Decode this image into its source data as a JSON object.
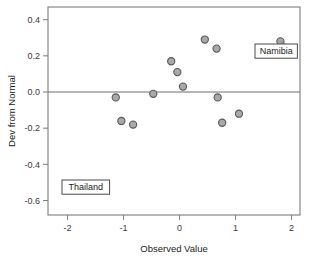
{
  "chart_data": {
    "type": "scatter",
    "title": "",
    "xlabel": "Observed Value",
    "ylabel": "Dev from Normal",
    "xlim": [
      -2.35,
      2.15
    ],
    "ylim": [
      -0.68,
      0.47
    ],
    "xticks": [
      "-2",
      "-1",
      "0",
      "1",
      "2"
    ],
    "xtick_values": [
      -2,
      -1,
      0,
      1,
      2
    ],
    "yticks": [
      "0.4",
      "0.2",
      "0.0",
      "-0.2",
      "-0.4",
      "-0.6"
    ],
    "ytick_values": [
      0.4,
      0.2,
      0.0,
      -0.2,
      -0.4,
      -0.6
    ],
    "grid": false,
    "legend": "none",
    "reference_line": {
      "axis": "y",
      "value": 0.0
    },
    "marker": {
      "shape": "circle",
      "fill": "#a9a9a9",
      "edge": "#585858",
      "radius": 3.6
    },
    "points": [
      {
        "x": -2.0,
        "y": -0.52,
        "label": "Thailand"
      },
      {
        "x": -1.14,
        "y": -0.03,
        "label": ""
      },
      {
        "x": -1.04,
        "y": -0.16,
        "label": ""
      },
      {
        "x": -0.83,
        "y": -0.18,
        "label": ""
      },
      {
        "x": -0.47,
        "y": -0.01,
        "label": ""
      },
      {
        "x": -0.15,
        "y": 0.17,
        "label": ""
      },
      {
        "x": -0.04,
        "y": 0.11,
        "label": ""
      },
      {
        "x": 0.06,
        "y": 0.03,
        "label": ""
      },
      {
        "x": 0.45,
        "y": 0.29,
        "label": ""
      },
      {
        "x": 0.66,
        "y": 0.24,
        "label": ""
      },
      {
        "x": 0.68,
        "y": -0.03,
        "label": ""
      },
      {
        "x": 0.76,
        "y": -0.17,
        "label": ""
      },
      {
        "x": 1.06,
        "y": -0.12,
        "label": ""
      },
      {
        "x": 1.8,
        "y": 0.28,
        "label": "Namibia"
      }
    ],
    "annotations": [
      {
        "text": "Namibia",
        "point_x": 1.8,
        "point_y": 0.28,
        "box_x": 255,
        "box_y": 44
      },
      {
        "text": "Thailand",
        "point_x": -2.0,
        "point_y": -0.52,
        "box_x": 62,
        "box_y": 180
      }
    ],
    "axis_color": "#7d7d7d",
    "frame": {
      "left": 48,
      "right": 300,
      "top": 7,
      "bottom": 215
    }
  }
}
